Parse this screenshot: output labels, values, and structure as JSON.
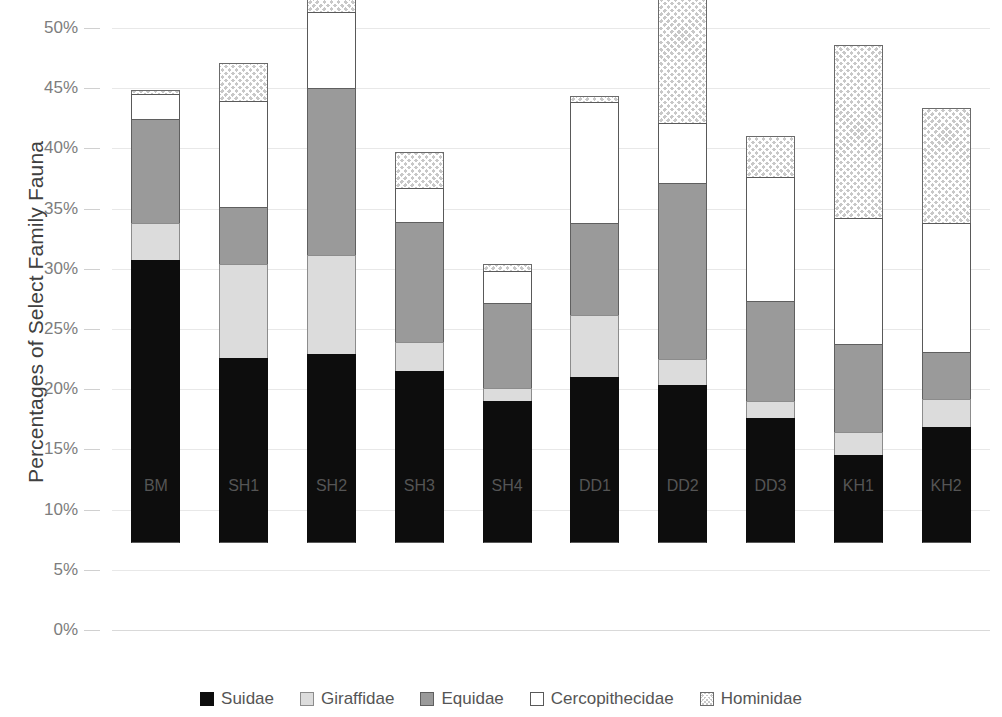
{
  "chart_data": {
    "type": "bar",
    "subtype": "stacked-bar",
    "title": "",
    "xlabel": "",
    "ylabel": "Percentages of Select Family Fauna",
    "ylim": [
      0,
      50
    ],
    "ytick_values": [
      0,
      5,
      10,
      15,
      20,
      25,
      30,
      35,
      40,
      45,
      50
    ],
    "ytick_labels": [
      "0%",
      "5%",
      "10%",
      "15%",
      "20%",
      "25%",
      "30%",
      "35%",
      "40%",
      "45%",
      "50%"
    ],
    "grid": true,
    "legend_position": "bottom",
    "categories": [
      "BM",
      "SH1",
      "SH2",
      "SH3",
      "SH4",
      "DD1",
      "DD2",
      "DD3",
      "KH1",
      "KH2"
    ],
    "series": [
      {
        "name": "Suidae",
        "color": "#0d0d0d",
        "pattern": "solid",
        "values": [
          23.5,
          15.4,
          15.7,
          14.3,
          11.8,
          13.8,
          13.1,
          10.4,
          7.3,
          9.6
        ]
      },
      {
        "name": "Giraffidae",
        "color": "#dcdcdc",
        "pattern": "solid-light",
        "values": [
          3.1,
          7.8,
          8.2,
          2.4,
          1.1,
          5.1,
          2.2,
          1.4,
          1.9,
          2.4
        ]
      },
      {
        "name": "Equidae",
        "color": "#9a9a9a",
        "pattern": "solid-mid",
        "values": [
          8.6,
          4.7,
          13.9,
          10.0,
          7.0,
          7.7,
          14.6,
          8.3,
          7.3,
          3.9
        ]
      },
      {
        "name": "Cercopithecidae",
        "color": "#ffffff",
        "pattern": "open",
        "values": [
          2.1,
          8.8,
          6.3,
          2.8,
          2.7,
          10.0,
          5.0,
          10.3,
          10.5,
          10.7
        ]
      },
      {
        "name": "Hominidae",
        "color": "#c8c8c8",
        "pattern": "crosshatch",
        "values": [
          0.3,
          3.2,
          2.1,
          3.0,
          0.6,
          0.5,
          11.3,
          3.4,
          14.4,
          9.5
        ]
      }
    ],
    "totals": [
      37.6,
      39.9,
      46.2,
      32.5,
      23.2,
      37.1,
      46.2,
      33.8,
      41.4,
      36.1
    ]
  },
  "legend": {
    "items": [
      {
        "label": "Suidae",
        "swatch": "suidae"
      },
      {
        "label": "Giraffidae",
        "swatch": "giraffidae"
      },
      {
        "label": "Equidae",
        "swatch": "equidae"
      },
      {
        "label": "Cercopithecidae",
        "swatch": "cercopithecidae"
      },
      {
        "label": "Hominidae",
        "swatch": "hominidae"
      }
    ]
  }
}
